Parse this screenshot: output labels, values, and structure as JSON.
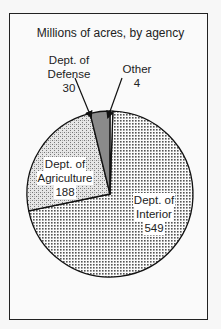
{
  "chart_data": {
    "type": "pie",
    "title": "Millions of acres, by agency",
    "start_angle_deg": -88,
    "direction": "clockwise",
    "slices": [
      {
        "name": "Dept. of Interior",
        "line1": "Dept. of",
        "line2": "Interior",
        "value": 549,
        "fill": "dots-fine"
      },
      {
        "name": "Dept. of Agriculture",
        "line1": "Dept. of",
        "line2": "Agriculture",
        "value": 188,
        "fill": "stipple"
      },
      {
        "name": "Dept. of Defense",
        "line1": "Dept. of",
        "line2": "Defense",
        "value": 30,
        "fill": "dark-gray"
      },
      {
        "name": "Other",
        "line1": "Other",
        "line2": "",
        "value": 4,
        "fill": "white"
      }
    ],
    "total": 771,
    "center": [
      110,
      194
    ],
    "radius": 83
  },
  "labels": {
    "interior": {
      "l1": "Dept. of",
      "l2": "Interior",
      "val": "549"
    },
    "agriculture": {
      "l1": "Dept. of",
      "l2": "Agriculture",
      "val": "188"
    },
    "defense": {
      "l1": "Dept. of",
      "l2": "Defense",
      "val": "30"
    },
    "other": {
      "l1": "Other",
      "val": "4"
    }
  },
  "colors": {
    "border": "#222222",
    "defense_fill": "#8a8a8a",
    "background": "#fafafa"
  }
}
